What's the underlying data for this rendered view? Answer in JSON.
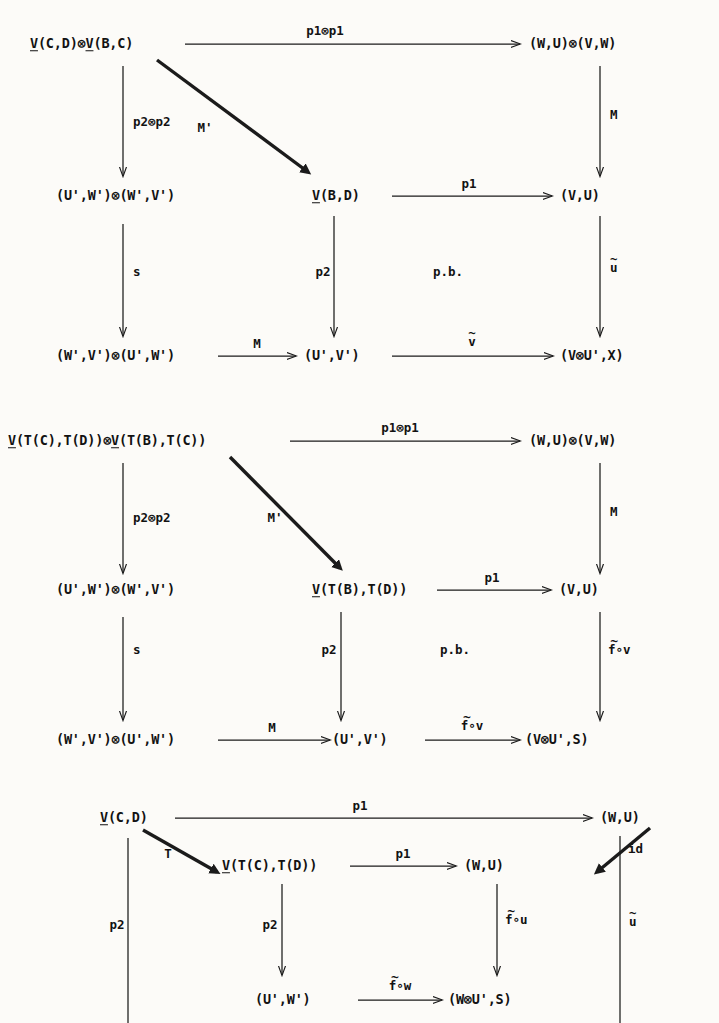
{
  "document": {
    "type": "commutative-diagram-page",
    "ink_color": "#1b1b1b",
    "paper_color": "#fcfbf8",
    "diagram_count": 3
  },
  "diagram1": {
    "nodes": {
      "top_left": "V(C,D)⊗V(B,C)",
      "top_right": "(W,U)⊗(V,W)",
      "mid_left": "(U',W')⊗(W',V')",
      "mid_center": "V(B,D)",
      "mid_right": "(V,U)",
      "bot_left": "(W',V')⊗(U',W')",
      "bot_center": "(U',V')",
      "bot_right": "(V⊗U',X)"
    },
    "labels": {
      "top_horizontal": "p1⊗p1",
      "left_vertical_1": "p2⊗p2",
      "diagonal": "M'",
      "right_vertical_1": "M",
      "mid_horizontal": "p1",
      "left_vertical_2": "s",
      "center_vertical": "p2",
      "pullback": "p.b.",
      "right_vertical_2": "u",
      "right_vertical_2_accent": "~",
      "bot_horizontal_left": "M",
      "bot_horizontal_right": "v",
      "bot_horizontal_right_accent": "~"
    }
  },
  "diagram2": {
    "nodes": {
      "top_left": "V(T(C),T(D))⊗V(T(B),T(C))",
      "top_right": "(W,U)⊗(V,W)",
      "mid_left": "(U',W')⊗(W',V')",
      "mid_center": "V(T(B),T(D))",
      "mid_right": "(V,U)",
      "bot_left": "(W',V')⊗(U',W')",
      "bot_center": "(U',V')",
      "bot_right": "(V⊗U',S)"
    },
    "labels": {
      "top_horizontal": "p1⊗p1",
      "left_vertical_1": "p2⊗p2",
      "diagonal": "M'",
      "right_vertical_1": "M",
      "mid_horizontal": "p1",
      "left_vertical_2": "s",
      "center_vertical": "p2",
      "pullback": "p.b.",
      "right_vertical_2": "f∘v",
      "right_vertical_2_accent": "~",
      "bot_horizontal_left": "M",
      "bot_horizontal_right": "f∘v",
      "bot_horizontal_right_accent": "~"
    }
  },
  "diagram3": {
    "nodes": {
      "top_left": "V(C,D)",
      "top_right": "(W,U)",
      "mid_left": "V(T(C),T(D))",
      "mid_right": "(W,U)",
      "bot_left": "(U',W')",
      "bot_right": "(W⊗U',S)"
    },
    "labels": {
      "top_horizontal": "p1",
      "diagonal_left": "T",
      "diagonal_right": "id",
      "outer_left_vertical": "p2",
      "inner_left_vertical": "p2",
      "mid_horizontal": "p1",
      "inner_right_vertical": "f∘u",
      "inner_right_vertical_accent": "~",
      "outer_right_vertical": "u",
      "outer_right_vertical_accent": "~",
      "bot_horizontal": "f∘w",
      "bot_horizontal_accent": "~"
    }
  }
}
